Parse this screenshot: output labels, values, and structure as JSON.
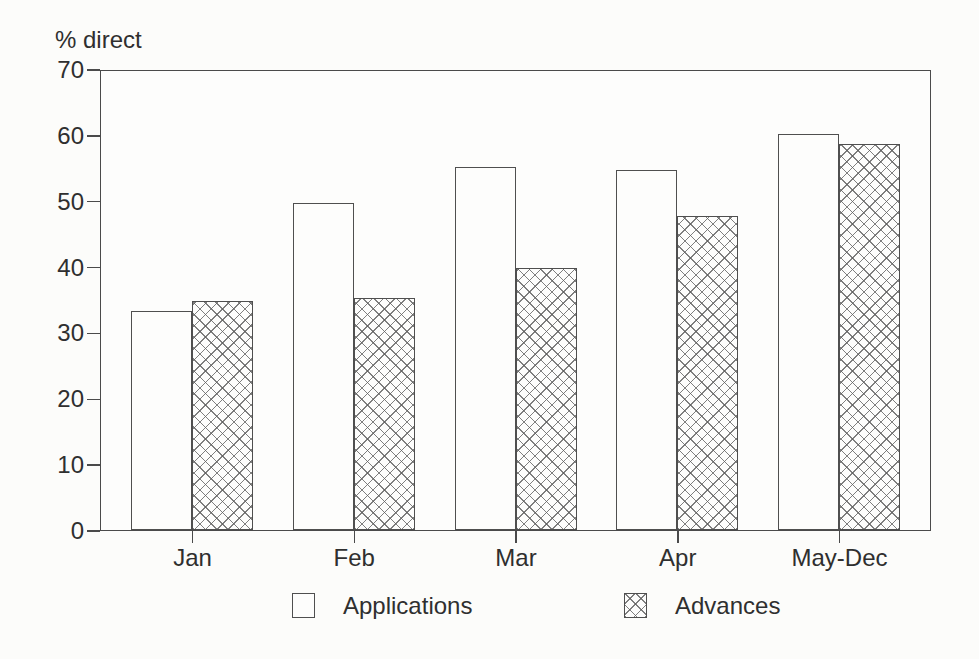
{
  "figure": {
    "ylabel": "% direct",
    "background_color": "#fcfcfa",
    "line_color": "#4a4a4a",
    "text_color": "#2f2f2f"
  },
  "chart_data": {
    "type": "bar",
    "categories": [
      "Jan",
      "Feb",
      "Mar",
      "Apr",
      "May-Dec"
    ],
    "series": [
      {
        "name": "Applications",
        "style": "plain",
        "values": [
          33.5,
          50,
          55.5,
          55,
          60.5
        ]
      },
      {
        "name": "Advances",
        "style": "crosshatch",
        "values": [
          35,
          35.5,
          40,
          48,
          59
        ]
      }
    ],
    "title": "",
    "xlabel": "",
    "ylabel": "% direct",
    "ylim": [
      0,
      70
    ],
    "yticks": [
      0,
      10,
      20,
      30,
      40,
      50,
      60,
      70
    ],
    "grid": false,
    "legend_position": "bottom"
  },
  "legend": {
    "items": [
      {
        "label": "Applications",
        "swatch": "plain"
      },
      {
        "label": "Advances",
        "swatch": "crosshatch"
      }
    ]
  }
}
